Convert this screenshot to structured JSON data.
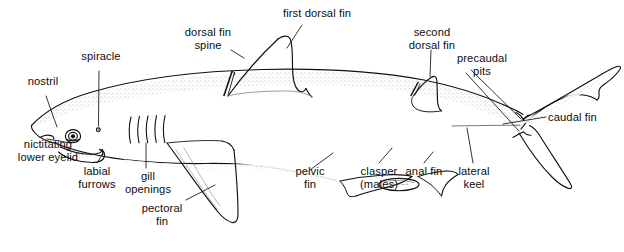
{
  "figure": {
    "style": "line drawing with stipple shading",
    "background_color": "#ffffff",
    "line_color": "#111111",
    "label_color": "#0d0d0d"
  },
  "labels": {
    "nostril": "nostril",
    "spiracle": "spiracle",
    "nictitating_lower_eyelid_line1": "nictitating",
    "nictitating_lower_eyelid_line2": "lower eyelid",
    "labial_furrows_line1": "labial",
    "labial_furrows_line2": "furrows",
    "gill_openings_line1": "gill",
    "gill_openings_line2": "openings",
    "pectoral_fin_line1": "pectoral",
    "pectoral_fin_line2": "fin",
    "dorsal_fin_spine_line1": "dorsal fin",
    "dorsal_fin_spine_line2": "spine",
    "first_dorsal_fin": "first dorsal fin",
    "second_dorsal_fin_line1": "second",
    "second_dorsal_fin_line2": "dorsal fin",
    "precaudal_pits_line1": "precaudal",
    "precaudal_pits_line2": "pits",
    "caudal_fin": "caudal fin",
    "lateral_keel_line1": "lateral",
    "lateral_keel_line2": "keel",
    "anal_fin": "anal fin",
    "clasper_line1": "clasper",
    "clasper_line2": "(males)",
    "pelvic_fin_line1": "pelvic",
    "pelvic_fin_line2": "fin"
  },
  "parts": [
    {
      "id": "nostril",
      "name": "nostril"
    },
    {
      "id": "spiracle",
      "name": "spiracle"
    },
    {
      "id": "nictitating-lower-eyelid",
      "name": "nictitating lower eyelid"
    },
    {
      "id": "labial-furrows",
      "name": "labial furrows"
    },
    {
      "id": "gill-openings",
      "name": "gill openings",
      "count": 5
    },
    {
      "id": "pectoral-fin",
      "name": "pectoral fin"
    },
    {
      "id": "dorsal-fin-spine",
      "name": "dorsal fin spine"
    },
    {
      "id": "first-dorsal-fin",
      "name": "first dorsal fin"
    },
    {
      "id": "second-dorsal-fin",
      "name": "second dorsal fin"
    },
    {
      "id": "precaudal-pits",
      "name": "precaudal pits"
    },
    {
      "id": "caudal-fin",
      "name": "caudal fin"
    },
    {
      "id": "lateral-keel",
      "name": "lateral keel"
    },
    {
      "id": "anal-fin",
      "name": "anal fin"
    },
    {
      "id": "clasper",
      "name": "clasper (males)"
    },
    {
      "id": "pelvic-fin",
      "name": "pelvic fin"
    }
  ]
}
